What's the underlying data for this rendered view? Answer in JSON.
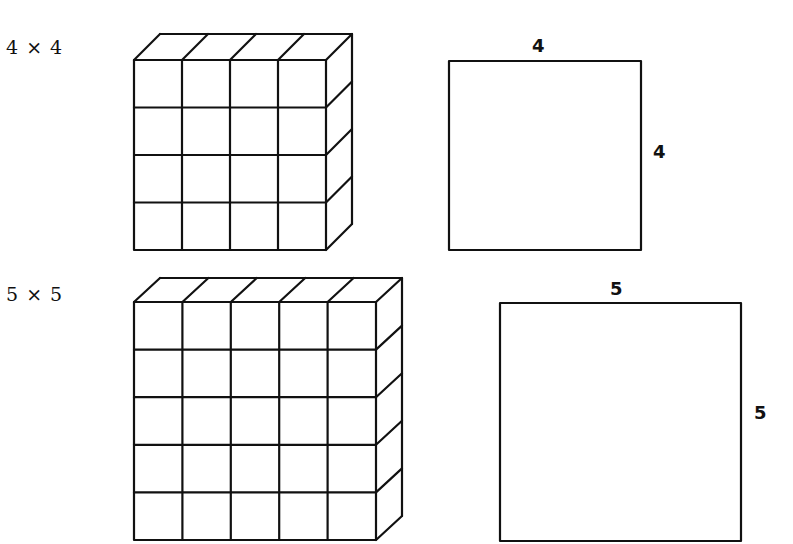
{
  "figures": [
    {
      "id": "four",
      "caption": "4 × 4",
      "grid": {
        "rows": 4,
        "cols": 4,
        "front": {
          "x": 134,
          "y": 60,
          "w": 192,
          "h": 190
        },
        "depth": {
          "dx": 26,
          "dy": -26
        }
      },
      "square": {
        "x": 449,
        "y": 61,
        "w": 192,
        "h": 189,
        "top_label": "4",
        "side_label": "4"
      }
    },
    {
      "id": "five",
      "caption": "5 × 5",
      "grid": {
        "rows": 5,
        "cols": 5,
        "front": {
          "x": 134,
          "y": 302,
          "w": 242,
          "h": 238
        },
        "depth": {
          "dx": 26,
          "dy": -24
        }
      },
      "square": {
        "x": 500,
        "y": 303,
        "w": 241,
        "h": 238,
        "top_label": "5",
        "side_label": "5"
      }
    }
  ]
}
